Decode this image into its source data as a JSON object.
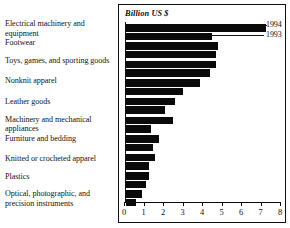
{
  "chart_data": {
    "type": "bar",
    "orientation": "horizontal",
    "title": "Billion US $",
    "xlabel": "",
    "ylabel": "",
    "xlim": [
      0,
      8
    ],
    "xticks": [
      0,
      1,
      2,
      3,
      4,
      5,
      6,
      7,
      8
    ],
    "grid": false,
    "legend_position": "top-right",
    "categories": [
      "Electrical machinery and equipment",
      "Footwear",
      "Toys, games, and sporting goods",
      "Nonknit apparel",
      "Leather goods",
      "Machinery and mechanical appliances",
      "Furniture and bedding",
      "Knitted or crocheted apparel",
      "Plastics",
      "Optical, photographic, and precision instruments"
    ],
    "series": [
      {
        "name": "1994",
        "values": [
          7.2,
          4.7,
          4.6,
          3.8,
          2.5,
          2.4,
          1.7,
          1.5,
          1.2,
          0.8
        ]
      },
      {
        "name": "1993",
        "values": [
          4.4,
          4.6,
          4.3,
          2.9,
          2.0,
          1.3,
          1.4,
          1.2,
          1.0,
          0.5
        ]
      }
    ]
  },
  "legend": {
    "entries": [
      {
        "label": "1994"
      },
      {
        "label": "1993"
      }
    ]
  },
  "axis": {
    "tick_labels": [
      "0",
      "1",
      "2",
      "3",
      "4",
      "5",
      "6",
      "7",
      "8"
    ]
  },
  "colors": {
    "bar": "#0a0a0a",
    "axis": "#0d0d0d",
    "border": "#101010",
    "text": "#131313",
    "background": "#ffffff"
  }
}
